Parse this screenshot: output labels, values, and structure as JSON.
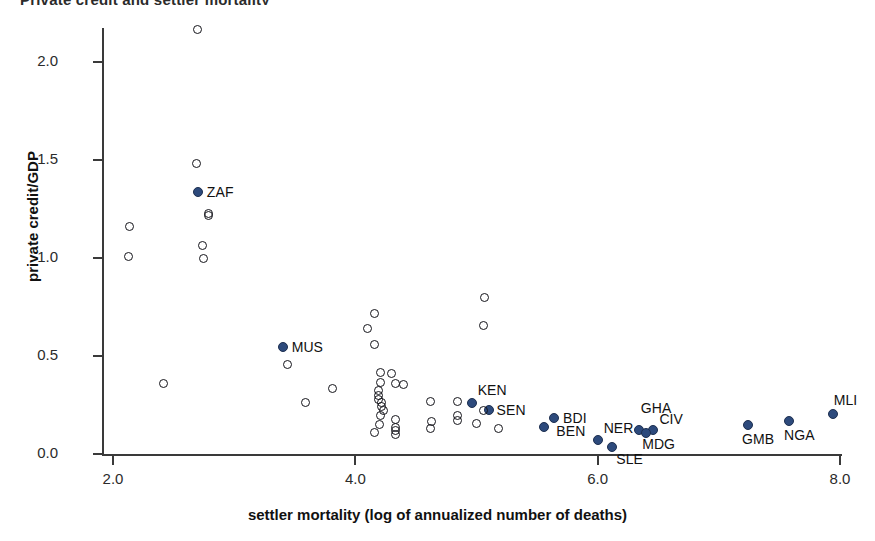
{
  "chart_data": {
    "type": "scatter",
    "title": "Private credit and settler mortality",
    "xlabel": "settler mortality (log of annualized number of deaths)",
    "ylabel": "private credit/GDP",
    "xlim": [
      2.0,
      8.0
    ],
    "ylim": [
      0.0,
      2.2
    ],
    "xticks": [
      "2.0",
      "4.0",
      "6.0",
      "8.0"
    ],
    "xtick_values": [
      2.0,
      4.0,
      6.0,
      8.0
    ],
    "yticks": [
      "0.0",
      "0.5",
      "1.0",
      "1.5",
      "2.0"
    ],
    "ytick_values": [
      0.0,
      0.5,
      1.0,
      1.5,
      2.0
    ],
    "grid": false,
    "legend": "none",
    "marker_colors": {
      "highlighted": "#2d4a7c",
      "other": "#15151b"
    },
    "series": [
      {
        "name": "African countries (labeled)",
        "marker": "filled-circle",
        "color": "#2d4a7c",
        "points": [
          {
            "label": "ZAF",
            "x": 2.7,
            "y": 1.335,
            "label_dx": 9,
            "label_dy": -8
          },
          {
            "label": "MUS",
            "x": 3.4,
            "y": 0.548,
            "label_dx": 9,
            "label_dy": -8
          },
          {
            "label": "KEN",
            "x": 4.96,
            "y": 0.262,
            "label_dx": 6,
            "label_dy": -21
          },
          {
            "label": "SEN",
            "x": 5.1,
            "y": 0.222,
            "label_dx": 8,
            "label_dy": -8
          },
          {
            "label": "BDI",
            "x": 5.64,
            "y": 0.186,
            "label_dx": 9,
            "label_dy": -8
          },
          {
            "label": "BEN",
            "x": 5.56,
            "y": 0.14,
            "label_dx": 12,
            "label_dy": -4
          },
          {
            "label": "NER",
            "x": 6.0,
            "y": 0.072,
            "label_dx": 6,
            "label_dy": -20
          },
          {
            "label": "SLE",
            "x": 6.12,
            "y": 0.038,
            "label_dx": 4,
            "label_dy": 4
          },
          {
            "label": "GHA",
            "x": 6.34,
            "y": 0.12,
            "label_dx": 2,
            "label_dy": -30
          },
          {
            "label": "CIV",
            "x": 6.46,
            "y": 0.12,
            "label_dx": 6,
            "label_dy": -19
          },
          {
            "label": "MDG",
            "x": 6.4,
            "y": 0.106,
            "label_dx": -4,
            "label_dy": 3
          },
          {
            "label": "GMB",
            "x": 7.24,
            "y": 0.148,
            "label_dx": -6,
            "label_dy": 6
          },
          {
            "label": "NGA",
            "x": 7.58,
            "y": 0.166,
            "label_dx": -5,
            "label_dy": 6
          },
          {
            "label": "MLI",
            "x": 7.94,
            "y": 0.205,
            "label_dx": 1,
            "label_dy": -22
          }
        ]
      },
      {
        "name": "Other countries (unlabeled)",
        "marker": "hollow-circle",
        "color": "#15151b",
        "points": [
          {
            "x": 2.7,
            "y": 2.165
          },
          {
            "x": 2.14,
            "y": 1.16
          },
          {
            "x": 2.13,
            "y": 1.01
          },
          {
            "x": 2.69,
            "y": 1.48
          },
          {
            "x": 2.79,
            "y": 1.225
          },
          {
            "x": 2.79,
            "y": 1.215
          },
          {
            "x": 2.74,
            "y": 1.065
          },
          {
            "x": 2.75,
            "y": 1.0
          },
          {
            "x": 2.42,
            "y": 0.36
          },
          {
            "x": 3.44,
            "y": 0.455
          },
          {
            "x": 3.59,
            "y": 0.265
          },
          {
            "x": 3.81,
            "y": 0.335
          },
          {
            "x": 4.16,
            "y": 0.715
          },
          {
            "x": 4.1,
            "y": 0.64
          },
          {
            "x": 4.16,
            "y": 0.56
          },
          {
            "x": 4.21,
            "y": 0.415
          },
          {
            "x": 4.3,
            "y": 0.41
          },
          {
            "x": 4.21,
            "y": 0.365
          },
          {
            "x": 4.33,
            "y": 0.36
          },
          {
            "x": 4.4,
            "y": 0.355
          },
          {
            "x": 4.19,
            "y": 0.322
          },
          {
            "x": 4.19,
            "y": 0.3
          },
          {
            "x": 4.19,
            "y": 0.28
          },
          {
            "x": 4.22,
            "y": 0.262
          },
          {
            "x": 4.22,
            "y": 0.242
          },
          {
            "x": 4.23,
            "y": 0.222
          },
          {
            "x": 4.21,
            "y": 0.195
          },
          {
            "x": 4.2,
            "y": 0.15
          },
          {
            "x": 4.16,
            "y": 0.11
          },
          {
            "x": 4.33,
            "y": 0.175
          },
          {
            "x": 4.33,
            "y": 0.135
          },
          {
            "x": 4.33,
            "y": 0.118
          },
          {
            "x": 4.33,
            "y": 0.1
          },
          {
            "x": 4.62,
            "y": 0.27
          },
          {
            "x": 4.63,
            "y": 0.165
          },
          {
            "x": 4.62,
            "y": 0.13
          },
          {
            "x": 5.07,
            "y": 0.8
          },
          {
            "x": 5.06,
            "y": 0.655
          },
          {
            "x": 4.84,
            "y": 0.27
          },
          {
            "x": 4.84,
            "y": 0.195
          },
          {
            "x": 4.84,
            "y": 0.172
          },
          {
            "x": 5.0,
            "y": 0.155
          },
          {
            "x": 5.18,
            "y": 0.13
          },
          {
            "x": 5.06,
            "y": 0.222
          }
        ]
      }
    ]
  },
  "axes": {
    "x_title": "settler mortality (log of annualized number of deaths)",
    "y_title": "private credit/GDP"
  }
}
